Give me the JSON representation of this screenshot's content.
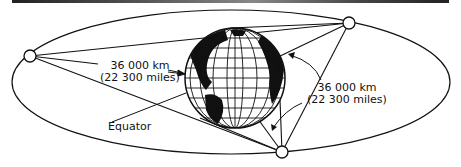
{
  "diagram": {
    "labels": {
      "left_distance_km": "36 000 km",
      "left_distance_miles": "(22 300 miles)",
      "right_distance_km": "36 000 km",
      "right_distance_miles": "(22 300 miles)",
      "equator": "Equator"
    },
    "satellites": [
      {
        "name": "left",
        "x": 30,
        "y": 56
      },
      {
        "name": "top-right",
        "x": 349,
        "y": 23
      },
      {
        "name": "bottom",
        "x": 282,
        "y": 152
      }
    ],
    "globe": {
      "cx": 235,
      "cy": 78,
      "r": 50
    },
    "colors": {
      "line": "#111111",
      "background": "#ffffff",
      "land": "#111111"
    }
  }
}
